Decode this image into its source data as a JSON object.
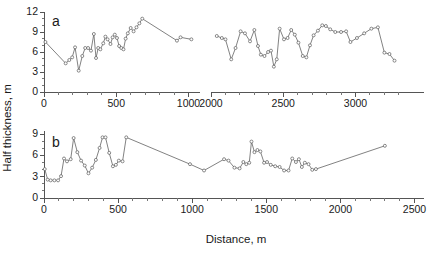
{
  "figure": {
    "title": "",
    "xlabel": "Distance, m",
    "ylabel": "Half thickness, m",
    "panel_a_label": "a",
    "panel_b_label": "b",
    "line_color": "#6b6b6b",
    "marker_fill": "#ffffff",
    "marker_stroke": "#5a5a5a",
    "axis_color": "#555555",
    "background": "#ffffff"
  },
  "chart_data": [
    {
      "type": "line",
      "panel": "a",
      "title": "a",
      "xlabel": "Distance, m",
      "ylabel": "Half thickness, m",
      "xlim": [
        0,
        3300
      ],
      "ylim": [
        0,
        12
      ],
      "axis_break": [
        1100,
        2000
      ],
      "grid": false,
      "legend": "none",
      "x_major_ticks": [
        0,
        500,
        1000,
        2000,
        2500,
        3000
      ],
      "x_minor_step": 100,
      "y_major_ticks": [
        0,
        3,
        6,
        9,
        12
      ],
      "y_minor_step": 1,
      "markers": "open-circle",
      "series": [
        {
          "name": "segment-1",
          "x": [
            10,
            150,
            175,
            195,
            215,
            240,
            265,
            285,
            305,
            325,
            345,
            360,
            375,
            390,
            410,
            425,
            440,
            460,
            475,
            490,
            505,
            520,
            535,
            550,
            565,
            580,
            600,
            620,
            640,
            660,
            680,
            920,
            945,
            1020
          ],
          "y": [
            7.5,
            4.3,
            4.8,
            5.2,
            6.7,
            3.2,
            5.4,
            6.6,
            6.6,
            6.2,
            8.7,
            5.1,
            6.6,
            6.4,
            7.3,
            8.3,
            7.9,
            7.2,
            8.2,
            8.6,
            8.1,
            6.9,
            6.6,
            6.4,
            8.0,
            8.8,
            9.6,
            9.1,
            9.7,
            10.3,
            11.0,
            7.7,
            8.2,
            7.9
          ]
        },
        {
          "name": "segment-2",
          "x": [
            2040,
            2075,
            2100,
            2140,
            2170,
            2205,
            2235,
            2270,
            2300,
            2325,
            2345,
            2370,
            2395,
            2415,
            2435,
            2455,
            2475,
            2505,
            2530,
            2555,
            2580,
            2605,
            2635,
            2660,
            2685,
            2710,
            2740,
            2770,
            2795,
            2825,
            2860,
            2900,
            2935,
            2965,
            3010,
            3060,
            3110,
            3155,
            3200,
            3235,
            3270
          ],
          "y": [
            8.4,
            8.1,
            7.9,
            4.9,
            6.6,
            9.1,
            8.8,
            7.6,
            9.3,
            6.9,
            5.6,
            5.4,
            6.0,
            6.2,
            3.8,
            4.9,
            9.5,
            7.9,
            8.1,
            9.3,
            8.6,
            7.4,
            5.4,
            5.2,
            7.0,
            8.5,
            9.2,
            10.0,
            9.9,
            9.4,
            9.0,
            9.0,
            9.1,
            7.5,
            8.1,
            8.8,
            9.5,
            9.7,
            5.9,
            5.7,
            4.7
          ]
        }
      ]
    },
    {
      "type": "line",
      "panel": "b",
      "title": "b",
      "xlabel": "Distance, m",
      "ylabel": "Half thickness, m",
      "xlim": [
        0,
        2550
      ],
      "ylim": [
        0,
        9.5
      ],
      "grid": false,
      "legend": "none",
      "x_major_ticks": [
        0,
        500,
        1000,
        1500,
        2000,
        2500
      ],
      "x_minor_step": 100,
      "y_major_ticks": [
        0,
        3,
        6,
        9
      ],
      "y_minor_step": 1,
      "markers": "open-circle",
      "series": [
        {
          "name": "segment-1",
          "x": [
            5,
            25,
            45,
            70,
            95,
            115,
            135,
            155,
            180,
            200,
            225,
            250,
            275,
            300,
            325,
            350,
            375,
            395,
            415,
            440,
            465,
            485,
            505,
            530,
            555,
            985,
            1080,
            1215,
            1245,
            1285,
            1320,
            1345,
            1365,
            1385,
            1400,
            1420,
            1440,
            1460,
            1485,
            1505,
            1530,
            1560,
            1590,
            1620,
            1650,
            1675,
            1700,
            1720,
            1740,
            1760,
            1785,
            1810,
            1835,
            2300
          ],
          "y": [
            4.1,
            2.6,
            2.5,
            2.5,
            2.5,
            3.1,
            5.6,
            5.2,
            5.5,
            8.5,
            6.5,
            5.3,
            4.6,
            3.5,
            4.3,
            5.4,
            7.1,
            8.6,
            8.6,
            6.4,
            4.5,
            4.7,
            5.3,
            5.2,
            8.6,
            4.8,
            3.9,
            5.5,
            5.3,
            4.3,
            4.2,
            5.1,
            4.8,
            5.0,
            8.0,
            6.5,
            6.8,
            6.6,
            5.0,
            5.1,
            4.7,
            4.5,
            4.4,
            3.9,
            3.9,
            5.6,
            5.1,
            5.5,
            4.4,
            5.0,
            4.8,
            4.0,
            4.1,
            7.4
          ]
        }
      ]
    }
  ],
  "geometry": {
    "panel_a": {
      "plot_left": 44,
      "plot_right_seg1": 200,
      "plot_left_seg2": 211,
      "plot_right": 424,
      "axis_y": 92,
      "y_top_px": 12,
      "y_bottom_px": 92,
      "x_scale_px_per_m": 0.1445,
      "seg2_x_origin_m": 2000
    },
    "panel_b": {
      "plot_left": 44,
      "plot_right": 424,
      "axis_y": 198,
      "y_top_px": 131,
      "y_bottom_px": 198,
      "x_scale_px_per_m": 0.1482
    }
  }
}
